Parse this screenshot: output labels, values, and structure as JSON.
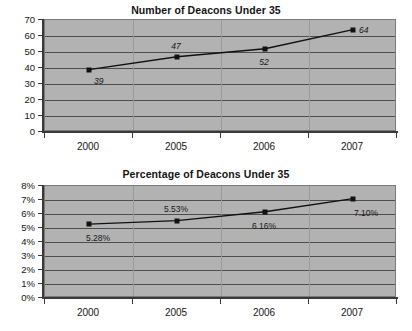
{
  "charts": [
    {
      "id": "deacons-count",
      "title": "Number of Deacons Under 35",
      "chart_data": {
        "type": "line",
        "title": "Number of Deacons Under 35",
        "xlabel": "",
        "ylabel": "",
        "categories": [
          "2000",
          "2005",
          "2006",
          "2007"
        ],
        "values": [
          39,
          47,
          52,
          64
        ],
        "point_labels": [
          "39",
          "47",
          "52",
          "64"
        ],
        "ylim": [
          0,
          70
        ],
        "yticks": [
          0,
          10,
          20,
          30,
          40,
          50,
          60,
          70
        ],
        "ytick_labels": [
          "0",
          "10",
          "20",
          "30",
          "40",
          "50",
          "60",
          "70"
        ],
        "grid": true,
        "legend": "none",
        "marker": "square",
        "plot_background": "#b2b2b2",
        "line_color": "#111111"
      }
    },
    {
      "id": "deacons-percentage",
      "title": "Percentage of Deacons Under 35",
      "chart_data": {
        "type": "line",
        "title": "Percentage of Deacons Under 35",
        "xlabel": "",
        "ylabel": "",
        "categories": [
          "2000",
          "2005",
          "2006",
          "2007"
        ],
        "values": [
          5.28,
          5.53,
          6.16,
          7.1
        ],
        "point_labels": [
          "5.28%",
          "5.53%",
          "6.16%",
          "7.10%"
        ],
        "ylim": [
          0,
          8
        ],
        "yticks": [
          0,
          1,
          2,
          3,
          4,
          5,
          6,
          7,
          8
        ],
        "ytick_labels": [
          "0%",
          "1%",
          "2%",
          "3%",
          "4%",
          "5%",
          "6%",
          "7%",
          "8%"
        ],
        "grid": true,
        "legend": "none",
        "marker": "square",
        "plot_background": "#b2b2b2",
        "line_color": "#111111"
      }
    }
  ]
}
